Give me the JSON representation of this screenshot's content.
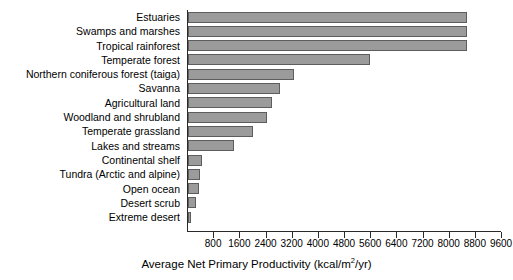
{
  "chart_data": {
    "type": "bar",
    "orientation": "horizontal",
    "title": "",
    "xlabel": "Average Net Primary Productivity (kcal/m²/yr)",
    "ylabel": "",
    "xlim": [
      0,
      9600
    ],
    "grid": false,
    "legend": false,
    "xticks": [
      800,
      1600,
      2400,
      3200,
      4000,
      4800,
      5600,
      6400,
      7200,
      8000,
      8800,
      9600
    ],
    "xtick_labels": [
      "800",
      "1600",
      "2400",
      "3200",
      "4000",
      "4800",
      "5600",
      "6400",
      "7200",
      "8000",
      "8800",
      "9600"
    ],
    "units": "kcal/m²/yr",
    "bar_color": "#9b9b9b",
    "bar_edge_color": "#5d5d5d",
    "axis_color": "#2a2a2a",
    "categories": [
      "Estuaries",
      "Swamps and marshes",
      "Tropical rainforest",
      "Temperate forest",
      "Northern coniferous forest (taiga)",
      "Savanna",
      "Agricultural land",
      "Woodland and shrubland",
      "Temperate grassland",
      "Lakes and streams",
      "Continental shelf",
      "Tundra (Arctic and alpine)",
      "Open ocean",
      "Desert scrub",
      "Extreme desert"
    ],
    "values": [
      8530,
      8530,
      8530,
      5550,
      3250,
      2820,
      2580,
      2420,
      2000,
      1400,
      430,
      370,
      340,
      245,
      30
    ]
  },
  "xtitle_parts": {
    "before": "Average Net Primary Productivity (kcal/m",
    "sup": "2",
    "after": "/yr)"
  }
}
